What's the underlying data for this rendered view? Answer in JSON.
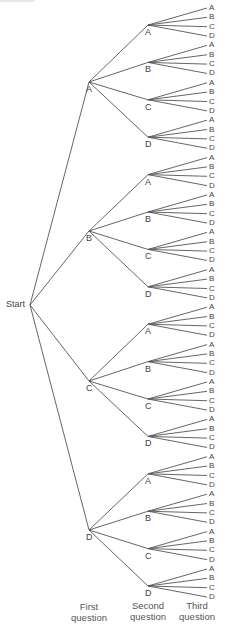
{
  "diagram": {
    "type": "tree",
    "root_label": "Start",
    "options": [
      "A",
      "B",
      "C",
      "D"
    ],
    "levels": 3,
    "column_labels": [
      {
        "line1": "First",
        "line2": "question"
      },
      {
        "line1": "Second",
        "line2": "question"
      },
      {
        "line1": "Third",
        "line2": "question"
      }
    ],
    "edge_color": "#555555",
    "text_color": "#444444"
  }
}
